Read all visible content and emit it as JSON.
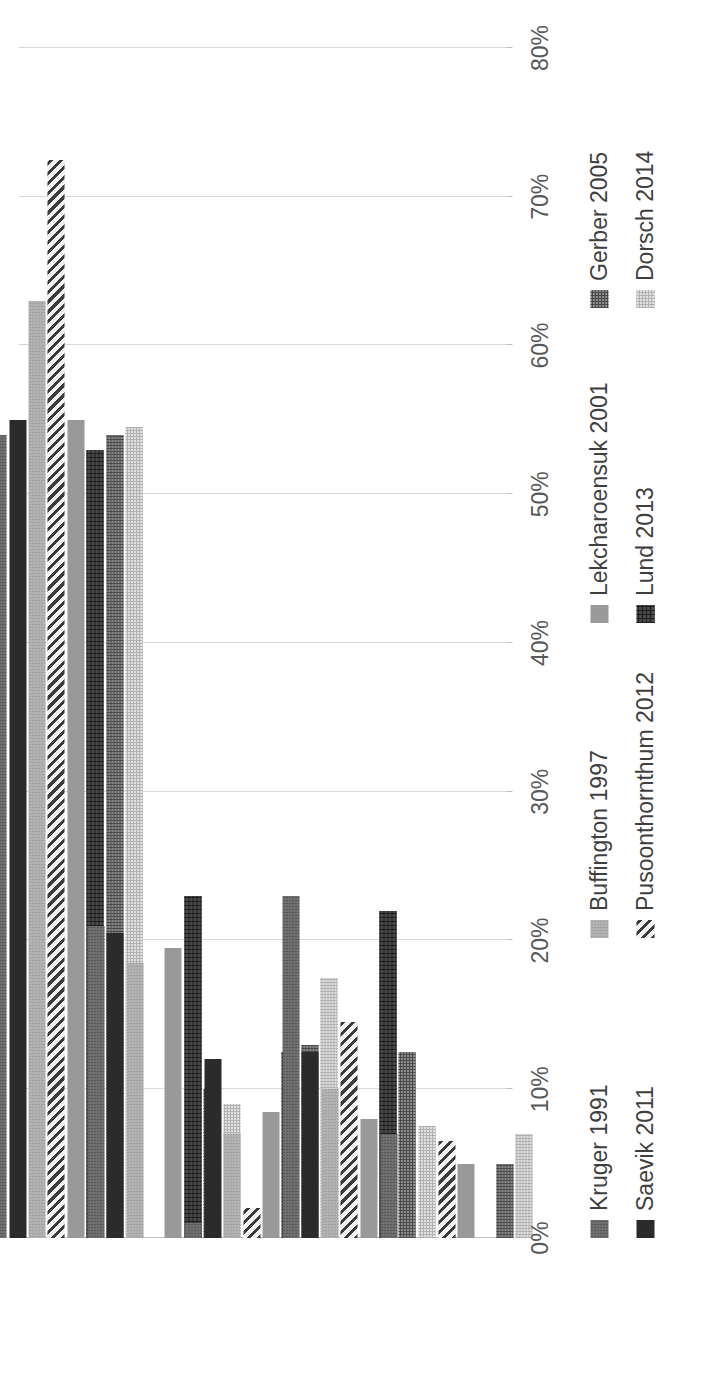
{
  "chart_data": {
    "type": "bar",
    "orientation": "horizontal-rotated",
    "title": "",
    "xlabel": "",
    "ylabel": "",
    "categories": [
      "FIC",
      "Plug",
      "UTI",
      "Urolith",
      "Other"
    ],
    "value_axis": {
      "ticks": [
        "0%",
        "10%",
        "20%",
        "30%",
        "40%",
        "50%",
        "60%",
        "70%",
        "80%"
      ],
      "tick_values": [
        0,
        10,
        20,
        30,
        40,
        50,
        60,
        70,
        80
      ],
      "min": 0,
      "max": 80,
      "unit": "%",
      "grid": true
    },
    "legend_position": "bottom",
    "series": [
      {
        "name": "Kruger 1991",
        "pattern": "dense-dots",
        "color": "#6f6f6f",
        "values": [
          54.0,
          21.0,
          1.0,
          23.0,
          7.0
        ]
      },
      {
        "name": "Saevik 2011",
        "pattern": "solid-dark",
        "color": "#2b2b2b",
        "values": [
          55.0,
          20.5,
          12.0,
          12.5,
          0.0
        ]
      },
      {
        "name": "Buffington 1997",
        "pattern": "light-dots",
        "color": "#b2b2b2",
        "values": [
          63.0,
          18.5,
          7.0,
          10.0,
          0.0
        ]
      },
      {
        "name": "Pusoonthornthum 2012",
        "pattern": "diagonal-stripes",
        "color": "#3b3b3b",
        "values": [
          72.5,
          0.0,
          2.0,
          14.5,
          6.5
        ]
      },
      {
        "name": "Lekcharoensuk 2001",
        "pattern": "solid-gray",
        "color": "#999999",
        "values": [
          55.0,
          19.5,
          8.5,
          8.0,
          5.0
        ]
      },
      {
        "name": "Lund 2013",
        "pattern": "dark-grid",
        "color": "#4a4a4a",
        "values": [
          53.0,
          23.0,
          12.5,
          22.0,
          0.0
        ]
      },
      {
        "name": "Gerber 2005",
        "pattern": "medium-checker",
        "color": "#8d8d8d",
        "values": [
          54.0,
          10.0,
          13.0,
          12.5,
          5.0
        ]
      },
      {
        "name": "Dorsch 2014",
        "pattern": "light-checker",
        "color": "#e2e2e2",
        "values": [
          54.5,
          9.0,
          17.5,
          7.5,
          7.0
        ]
      }
    ]
  },
  "legend": {
    "items": [
      {
        "label": "Kruger 1991"
      },
      {
        "label": "Saevik 2011"
      },
      {
        "label": "Buffington 1997"
      },
      {
        "label": "Pusoonthornthum 2012"
      },
      {
        "label": "Lekcharoensuk 2001"
      },
      {
        "label": "Lund 2013"
      },
      {
        "label": "Gerber 2005"
      },
      {
        "label": "Dorsch 2014"
      }
    ]
  }
}
